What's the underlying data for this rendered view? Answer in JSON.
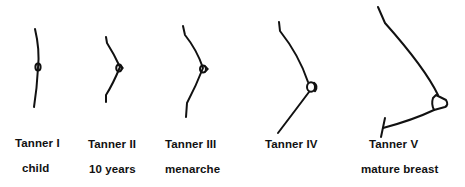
{
  "diagram": {
    "colors": {
      "stroke": "#111111",
      "background": "#ffffff"
    },
    "stages": [
      {
        "stage": "Tanner I",
        "description": "child"
      },
      {
        "stage": "Tanner II",
        "description": "10 years"
      },
      {
        "stage": "Tanner III",
        "description": "menarche"
      },
      {
        "stage": "Tanner IV",
        "description": ""
      },
      {
        "stage": "Tanner V",
        "description": "mature breast"
      }
    ]
  }
}
